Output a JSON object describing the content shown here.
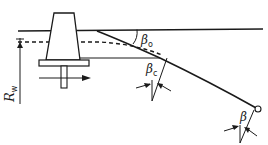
{
  "labels": {
    "rw_main": "R",
    "rw_sub": "w",
    "beta0_main": "β",
    "beta0_sub": "o",
    "betac_main": "β",
    "betac_sub": "c",
    "beta_main": "β"
  },
  "colors": {
    "ink": "#1a1a1a",
    "background": "#ffffff"
  }
}
